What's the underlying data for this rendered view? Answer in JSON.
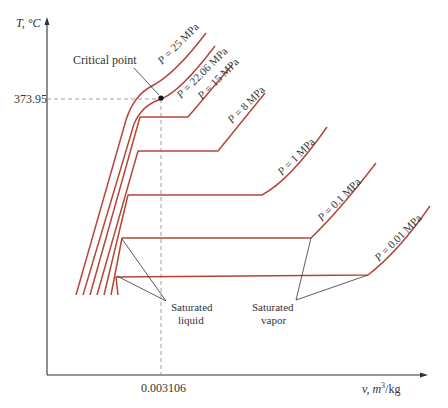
{
  "figure": {
    "y_axis_label": "T, °C",
    "x_axis_label_main": "v, m",
    "x_axis_label_sup": "3",
    "x_axis_label_tail": "/kg",
    "critical_temperature_tick": "373.95",
    "critical_volume_tick": "0.003106",
    "critical_point_label": "Critical point",
    "saturated_liquid_label_line1": "Saturated",
    "saturated_liquid_label_line2": "liquid",
    "saturated_vapor_label_line1": "Saturated",
    "saturated_vapor_label_line2": "vapor",
    "isobars": [
      {
        "label": "P = 25 MPa"
      },
      {
        "label": "P = 22.06 MPa"
      },
      {
        "label": "P = 15 MPa"
      },
      {
        "label": "P = 8 MPa"
      },
      {
        "label": "P = 1 MPa"
      },
      {
        "label": "P = 0.1 MPa"
      },
      {
        "label": "P = 0.01 MPa"
      }
    ],
    "colors": {
      "isobar": "#b5473a",
      "axis": "#333333",
      "dashed_guide": "#888888"
    }
  }
}
